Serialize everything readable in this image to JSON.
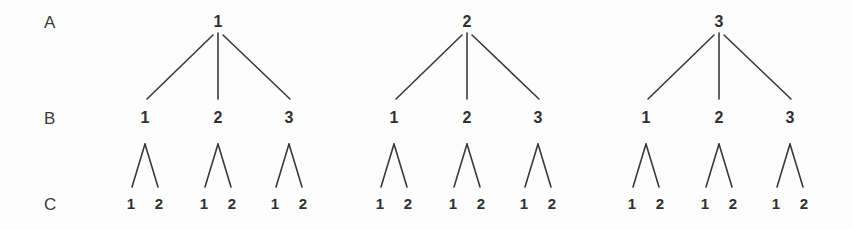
{
  "figure": {
    "type": "nested-design-tree-diagram",
    "background_color": "#fdfdfd",
    "line_color": "#3a3a3a",
    "text_color": "#303030",
    "width": 853,
    "height": 229
  },
  "row_labels": [
    {
      "text": "A",
      "x": 44,
      "y": 14
    },
    {
      "text": "B",
      "x": 44,
      "y": 110
    },
    {
      "text": "C",
      "x": 44,
      "y": 196
    }
  ],
  "trees": [
    {
      "root": {
        "label": "1",
        "x": 218,
        "y": 14
      },
      "level_b": [
        {
          "label": "1",
          "x": 145,
          "y": 110
        },
        {
          "label": "2",
          "x": 218,
          "y": 110
        },
        {
          "label": "3",
          "x": 289,
          "y": 110
        }
      ],
      "level_c": [
        {
          "label": "1",
          "x": 131,
          "y": 196
        },
        {
          "label": "2",
          "x": 159,
          "y": 196
        },
        {
          "label": "1",
          "x": 204,
          "y": 196
        },
        {
          "label": "2",
          "x": 232,
          "y": 196
        },
        {
          "label": "1",
          "x": 275,
          "y": 196
        },
        {
          "label": "2",
          "x": 303,
          "y": 196
        }
      ]
    },
    {
      "root": {
        "label": "2",
        "x": 467,
        "y": 14
      },
      "level_b": [
        {
          "label": "1",
          "x": 394,
          "y": 110
        },
        {
          "label": "2",
          "x": 467,
          "y": 110
        },
        {
          "label": "3",
          "x": 538,
          "y": 110
        }
      ],
      "level_c": [
        {
          "label": "1",
          "x": 380,
          "y": 196
        },
        {
          "label": "2",
          "x": 408,
          "y": 196
        },
        {
          "label": "1",
          "x": 453,
          "y": 196
        },
        {
          "label": "2",
          "x": 481,
          "y": 196
        },
        {
          "label": "1",
          "x": 524,
          "y": 196
        },
        {
          "label": "2",
          "x": 552,
          "y": 196
        }
      ]
    },
    {
      "root": {
        "label": "3",
        "x": 719,
        "y": 14
      },
      "level_b": [
        {
          "label": "1",
          "x": 646,
          "y": 110
        },
        {
          "label": "2",
          "x": 719,
          "y": 110
        },
        {
          "label": "3",
          "x": 790,
          "y": 110
        }
      ],
      "level_c": [
        {
          "label": "1",
          "x": 632,
          "y": 196
        },
        {
          "label": "2",
          "x": 660,
          "y": 196
        },
        {
          "label": "1",
          "x": 705,
          "y": 196
        },
        {
          "label": "2",
          "x": 733,
          "y": 196
        },
        {
          "label": "1",
          "x": 776,
          "y": 196
        },
        {
          "label": "2",
          "x": 804,
          "y": 196
        }
      ]
    }
  ],
  "edges": {
    "a_to_b": [
      {
        "x1": 213,
        "y1": 35,
        "x2": 147,
        "y2": 99
      },
      {
        "x1": 218,
        "y1": 33,
        "x2": 218,
        "y2": 99
      },
      {
        "x1": 223,
        "y1": 35,
        "x2": 290,
        "y2": 99
      },
      {
        "x1": 462,
        "y1": 35,
        "x2": 396,
        "y2": 99
      },
      {
        "x1": 467,
        "y1": 33,
        "x2": 467,
        "y2": 99
      },
      {
        "x1": 472,
        "y1": 35,
        "x2": 539,
        "y2": 99
      },
      {
        "x1": 714,
        "y1": 35,
        "x2": 648,
        "y2": 99
      },
      {
        "x1": 719,
        "y1": 33,
        "x2": 719,
        "y2": 99
      },
      {
        "x1": 724,
        "y1": 35,
        "x2": 791,
        "y2": 99
      }
    ],
    "b_to_c": [
      {
        "x1": 145,
        "y1": 144,
        "x2": 132,
        "y2": 187
      },
      {
        "x1": 145,
        "y1": 144,
        "x2": 158,
        "y2": 187
      },
      {
        "x1": 218,
        "y1": 144,
        "x2": 205,
        "y2": 187
      },
      {
        "x1": 218,
        "y1": 144,
        "x2": 231,
        "y2": 187
      },
      {
        "x1": 289,
        "y1": 144,
        "x2": 276,
        "y2": 187
      },
      {
        "x1": 289,
        "y1": 144,
        "x2": 302,
        "y2": 187
      },
      {
        "x1": 394,
        "y1": 144,
        "x2": 381,
        "y2": 187
      },
      {
        "x1": 394,
        "y1": 144,
        "x2": 407,
        "y2": 187
      },
      {
        "x1": 467,
        "y1": 144,
        "x2": 454,
        "y2": 187
      },
      {
        "x1": 467,
        "y1": 144,
        "x2": 480,
        "y2": 187
      },
      {
        "x1": 538,
        "y1": 144,
        "x2": 525,
        "y2": 187
      },
      {
        "x1": 538,
        "y1": 144,
        "x2": 551,
        "y2": 187
      },
      {
        "x1": 646,
        "y1": 144,
        "x2": 633,
        "y2": 187
      },
      {
        "x1": 646,
        "y1": 144,
        "x2": 659,
        "y2": 187
      },
      {
        "x1": 719,
        "y1": 144,
        "x2": 706,
        "y2": 187
      },
      {
        "x1": 719,
        "y1": 144,
        "x2": 732,
        "y2": 187
      },
      {
        "x1": 790,
        "y1": 144,
        "x2": 777,
        "y2": 187
      },
      {
        "x1": 790,
        "y1": 144,
        "x2": 803,
        "y2": 187
      }
    ]
  }
}
